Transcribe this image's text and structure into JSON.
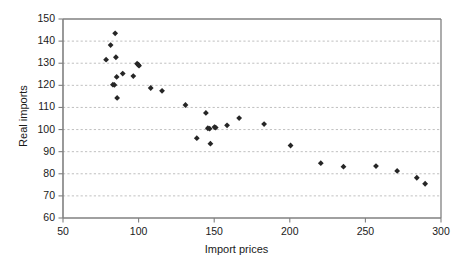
{
  "chart_data": {
    "type": "scatter",
    "title": "",
    "xlabel": "Import prices",
    "ylabel": "Real imports",
    "xlim": [
      50,
      300
    ],
    "ylim": [
      60,
      150
    ],
    "xticks": [
      50,
      100,
      150,
      200,
      250,
      300
    ],
    "yticks": [
      60,
      70,
      80,
      90,
      100,
      110,
      120,
      130,
      140,
      150
    ],
    "grid": "horizontal-dashed",
    "legend": "none",
    "marker": "diamond",
    "marker_color": "#262626",
    "series": [
      {
        "name": "observations",
        "points": [
          [
            78.5,
            131.6
          ],
          [
            81.5,
            138.2
          ],
          [
            83.0,
            120.3
          ],
          [
            84.0,
            120.2
          ],
          [
            84.5,
            143.5
          ],
          [
            85.0,
            132.7
          ],
          [
            85.5,
            123.8
          ],
          [
            85.8,
            114.3
          ],
          [
            89.5,
            125.3
          ],
          [
            96.5,
            124.2
          ],
          [
            99.0,
            129.8
          ],
          [
            99.8,
            129.3
          ],
          [
            100.3,
            128.9
          ],
          [
            108.0,
            118.8
          ],
          [
            115.5,
            117.5
          ],
          [
            131.0,
            111.1
          ],
          [
            138.5,
            96.1
          ],
          [
            144.5,
            107.5
          ],
          [
            145.8,
            100.6
          ],
          [
            147.0,
            100.4
          ],
          [
            147.5,
            93.6
          ],
          [
            150.2,
            101.1
          ],
          [
            151.0,
            100.9
          ],
          [
            158.5,
            101.9
          ],
          [
            166.5,
            105.2
          ],
          [
            183.0,
            102.5
          ],
          [
            200.5,
            92.8
          ],
          [
            220.5,
            84.8
          ],
          [
            235.5,
            83.2
          ],
          [
            257.0,
            83.5
          ],
          [
            271.0,
            81.3
          ],
          [
            284.0,
            78.2
          ],
          [
            289.5,
            75.5
          ]
        ]
      }
    ]
  },
  "axes": {
    "y_title": "Real imports",
    "x_title": "Import prices",
    "y_tick_labels": [
      "150",
      "140",
      "130",
      "120",
      "110",
      "100",
      "90",
      "80",
      "70",
      "60"
    ],
    "x_tick_labels": [
      "50",
      "100",
      "150",
      "200",
      "250",
      "300"
    ]
  },
  "colors": {
    "marker": "#262626",
    "axis": "#808080",
    "grid": "#b0b0b0",
    "text": "#1a1a1a",
    "background": "#ffffff"
  }
}
